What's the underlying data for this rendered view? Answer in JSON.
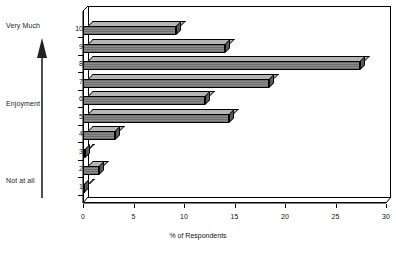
{
  "chart_data": {
    "type": "bar",
    "orientation": "horizontal",
    "title": "",
    "xlabel": "% of Respondents",
    "ylabel": "Enjoyment",
    "categories": [
      "1",
      "2",
      "3",
      "4",
      "5",
      "6",
      "7",
      "8",
      "9",
      "10"
    ],
    "values": [
      0.1,
      1.6,
      0.2,
      3.2,
      14.5,
      12.1,
      18.4,
      27.4,
      14.1,
      9.2
    ],
    "xlim": [
      0,
      30
    ],
    "xticks": [
      0,
      5,
      10,
      15,
      20,
      25,
      30
    ],
    "xtick_labels": [
      "0",
      "5",
      "10",
      "15",
      "20",
      "25",
      "30"
    ],
    "ylim": [
      0,
      11
    ],
    "ytick_labels": [
      "1",
      "2",
      "3",
      "4",
      "5",
      "6",
      "7",
      "8",
      "9",
      "10"
    ],
    "grid": false,
    "legend": false,
    "style": "3d-bar",
    "series": [
      {
        "name": "% of Respondents",
        "values": [
          0.1,
          1.6,
          0.2,
          3.2,
          14.5,
          12.1,
          18.4,
          27.4,
          14.1,
          9.2
        ]
      }
    ],
    "annotations": {
      "scale_top": "Very Much",
      "scale_middle": "Enjoyment",
      "scale_bottom": "Not at all",
      "scale_arrow": "upward-arrow"
    },
    "colors": {
      "bar_fill": "#8c8c8c",
      "bar_top": "#b5b5b5",
      "bar_side": "#5a5a5a",
      "axis": "#000000",
      "background": "#ffffff"
    }
  },
  "axis_labels": {
    "x_title": "% of Respondents"
  },
  "scale_annotation": {
    "top_label": "Very Much",
    "middle_label": "Enjoyment",
    "bottom_label": "Not at all"
  }
}
